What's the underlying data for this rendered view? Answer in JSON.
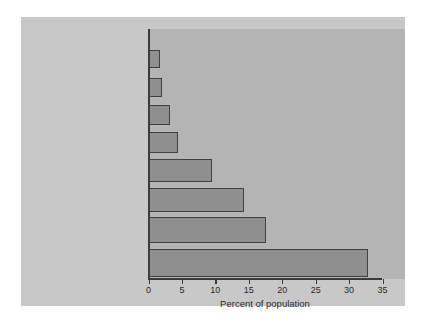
{
  "chart_data": {
    "type": "bar",
    "orientation": "horizontal",
    "title": "",
    "xlabel": "Percent of population",
    "ylabel": "",
    "xlim": [
      0,
      35
    ],
    "xticks": [
      0,
      5,
      10,
      15,
      20,
      25,
      30,
      35
    ],
    "grid": false,
    "legend": null,
    "categories": [
      "Panic disorder",
      "Schizophrenia",
      "Obsessive-compulsive disorder",
      "Antisocial personality",
      "Mood disorders (depression or mania)",
      "Phobia",
      "Alcohol or drug abuse",
      "Any disorder"
    ],
    "category_lines": [
      [
        "Panic disorder"
      ],
      [
        "Schizophrenia"
      ],
      [
        "Obsessive-",
        "compulsive disorder"
      ],
      [
        "Antisocial",
        "personality"
      ],
      [
        "Mood disorders",
        "(depression or mania)"
      ],
      [
        "Phobia"
      ],
      [
        "Alcohol or",
        "drug abuse"
      ],
      [
        "Any disorder"
      ]
    ],
    "values": [
      1.6,
      2.0,
      3.2,
      4.3,
      9.4,
      14.2,
      17.5,
      32.7
    ],
    "colors": {
      "bar_fill": "#8f8f8f",
      "bar_edge": "#404040",
      "plot_background": "#b4b4b4",
      "figure_background": "#c8c8c8",
      "page_background": "#ffffff",
      "text": "#2b2b2b"
    }
  }
}
